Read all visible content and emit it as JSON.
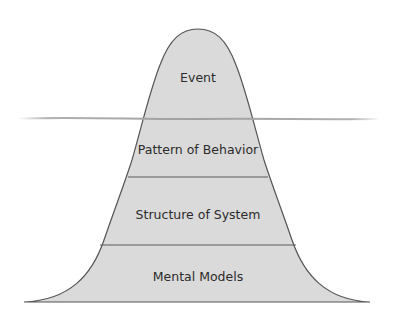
{
  "diagram": {
    "type": "iceberg-model",
    "colors": {
      "fill": "#dadada",
      "outline": "#555555",
      "divider": "#5a5a5a",
      "waterline": "#a8a8a8",
      "text": "#2b2b2b",
      "background": "#ffffff"
    },
    "layers": [
      {
        "label": "Event",
        "position": "above-water"
      },
      {
        "label": "Pattern of Behavior",
        "position": "below-water"
      },
      {
        "label": "Structure of System",
        "position": "below-water"
      },
      {
        "label": "Mental Models",
        "position": "below-water"
      }
    ]
  }
}
